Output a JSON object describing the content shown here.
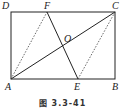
{
  "figure": {
    "caption": "图 3.3-41",
    "points": {
      "A": {
        "label": "A",
        "x": 11,
        "y": 79
      },
      "B": {
        "label": "B",
        "x": 115,
        "y": 79
      },
      "C": {
        "label": "C",
        "x": 115,
        "y": 12
      },
      "D": {
        "label": "D",
        "x": 11,
        "y": 12
      },
      "E": {
        "label": "E",
        "x": 78,
        "y": 79
      },
      "F": {
        "label": "F",
        "x": 47,
        "y": 12
      },
      "O": {
        "label": "O",
        "x": 63,
        "y": 46
      }
    },
    "solid_segments": [
      "AB",
      "BC",
      "CD",
      "DA",
      "AC",
      "EF"
    ],
    "dashed_segments": [
      "AF",
      "CE"
    ],
    "colors": {
      "line": "#222222",
      "background": "#ffffff"
    }
  }
}
